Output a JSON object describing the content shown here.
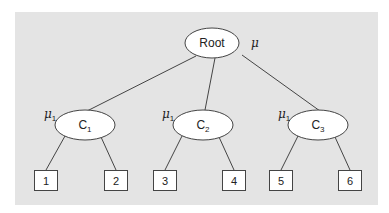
{
  "diagram": {
    "type": "tree",
    "root": {
      "label": "Root",
      "param": "μ"
    },
    "clusters": [
      {
        "label": "C",
        "sub": "1",
        "param": "μ",
        "param_sub": "1"
      },
      {
        "label": "C",
        "sub": "2",
        "param": "μ",
        "param_sub": "1"
      },
      {
        "label": "C",
        "sub": "3",
        "param": "μ",
        "param_sub": "1"
      }
    ],
    "leaves": [
      "1",
      "2",
      "3",
      "4",
      "5",
      "6"
    ],
    "edges": [
      [
        "Root",
        "C1"
      ],
      [
        "Root",
        "C2"
      ],
      [
        "Root",
        "C3"
      ],
      [
        "C1",
        "1"
      ],
      [
        "C1",
        "2"
      ],
      [
        "C2",
        "3"
      ],
      [
        "C2",
        "4"
      ],
      [
        "C3",
        "5"
      ],
      [
        "C3",
        "6"
      ]
    ],
    "colors": {
      "panel": "#e4e4e4",
      "node_fill": "#ffffff",
      "stroke": "#444444"
    }
  }
}
